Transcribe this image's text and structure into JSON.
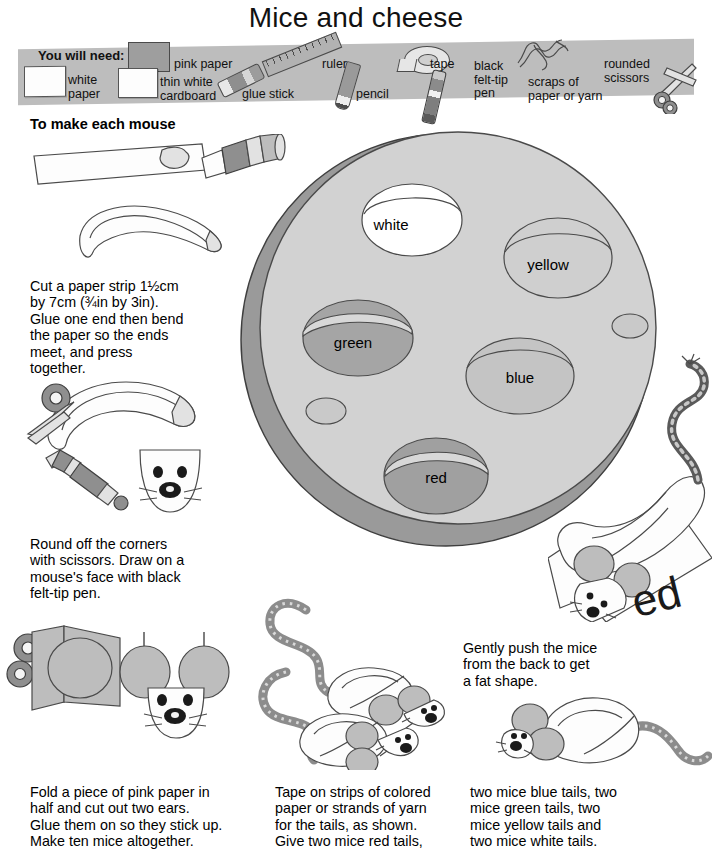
{
  "page": {
    "title": "Mice and cheese",
    "background_color": "#ffffff",
    "band_color": "#bdbdbd",
    "cheese_color": "#d2d2d2",
    "cheese_rim_color": "#9a9a9a"
  },
  "materials": {
    "heading": "You will need:",
    "items": [
      {
        "label": "white\npaper",
        "icon": "white-paper-icon"
      },
      {
        "label": "pink paper",
        "icon": "pink-paper-icon"
      },
      {
        "label": "thin white\ncardboard",
        "icon": "white-cardboard-icon"
      },
      {
        "label": "glue stick",
        "icon": "glue-stick-icon"
      },
      {
        "label": "ruler",
        "icon": "ruler-icon"
      },
      {
        "label": "pencil",
        "icon": "pencil-icon"
      },
      {
        "label": "tape",
        "icon": "tape-roll-icon"
      },
      {
        "label": "black\nfelt-tip\npen",
        "icon": "felt-tip-pen-icon"
      },
      {
        "label": "scraps of\npaper or yarn",
        "icon": "yarn-scraps-icon"
      },
      {
        "label": "rounded\nscissors",
        "icon": "scissors-icon"
      }
    ]
  },
  "steps": {
    "section_heading": "To make each mouse",
    "step1": "Cut a paper strip 1½cm\nby 7cm (¾in by 3in).\nGlue one end then bend\nthe paper so the ends\nmeet, and press\ntogether.",
    "step2": "Round off the corners\nwith scissors. Draw on a\nmouse's face with black\nfelt-tip pen.",
    "step3": "Fold a piece of pink paper in\nhalf and cut out two ears.\nGlue them on so they stick up.\nMake ten mice altogether.",
    "step4": "Tape on strips of colored\npaper or strands of yarn\nfor the tails, as shown.\nGive two mice red tails,",
    "step5": "two mice blue tails, two\nmice green tails, two\nmice yellow tails and\ntwo mice white tails.",
    "step6": "Gently push the mice\nfrom the back to get\na fat shape."
  },
  "cheese": {
    "holes": [
      {
        "label": "white",
        "fill": "#ffffff"
      },
      {
        "label": "yellow",
        "fill": "#cfcfcf"
      },
      {
        "label": "green",
        "fill": "#a5a5a5"
      },
      {
        "label": "blue",
        "fill": "#c4c4c4"
      },
      {
        "label": "red",
        "fill": "#a0a0a0"
      }
    ]
  },
  "card": {
    "word_fragment": "ed"
  }
}
